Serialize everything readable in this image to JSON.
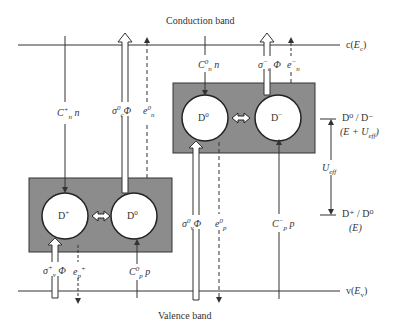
{
  "titles": {
    "conduction_band": "Conduction band",
    "valence_band": "Valence band"
  },
  "band_edges": {
    "conduction": {
      "prefix": "c(",
      "symbol": "E",
      "sub": "c",
      "suffix": ")"
    },
    "valence": {
      "prefix": "v(",
      "symbol": "E",
      "sub": "v",
      "suffix": ")"
    }
  },
  "states": {
    "left_box": {
      "left": "D",
      "left_sup": "+",
      "right": "D",
      "right_sup": "0"
    },
    "right_box": {
      "left": "D",
      "left_sup": "0",
      "right": "D",
      "right_sup": "−"
    }
  },
  "transitions": {
    "cn_plus": {
      "sym": "C",
      "sup": "+",
      "sub": "n",
      "var": "n"
    },
    "sigma_c0": {
      "sym": "σ",
      "sup": "0",
      "sub": "c",
      "var": "Φ"
    },
    "e_n0": {
      "sym": "e",
      "sup": "0",
      "sub": "n"
    },
    "cn0": {
      "sym": "C",
      "sup": "0",
      "sub": "n",
      "var": "n"
    },
    "sigma_c_minus": {
      "sym": "σ",
      "sup": "−",
      "sub": "c",
      "var": "Φ"
    },
    "e_n_minus": {
      "sym": "e",
      "sup": "−",
      "sub": "n"
    },
    "sigma_v_plus": {
      "sym": "σ",
      "sup": "+",
      "sub": "v",
      "var": "Φ"
    },
    "e_p_plus": {
      "sym": "e",
      "sup": "+",
      "sub": "p"
    },
    "cp0": {
      "sym": "C",
      "sup": "0",
      "sub": "p",
      "var": "p"
    },
    "sigma_v0": {
      "sym": "σ",
      "sup": "0",
      "sub": "v",
      "var": "Φ"
    },
    "e_p0": {
      "sym": "e",
      "sup": "0",
      "sub": "p"
    },
    "cp_minus": {
      "sym": "C",
      "sup": "−",
      "sub": "p",
      "var": "p"
    }
  },
  "levels": {
    "upper": {
      "label": "D⁰ / D⁻",
      "energy": "(E + U",
      "energy_sub": "eff",
      "energy_close": ")"
    },
    "lower": {
      "label": "D⁺ / D⁰",
      "energy": "(E)"
    },
    "separation": {
      "sym": "U",
      "sub": "eff"
    }
  },
  "colors": {
    "box_fill": "#8c8c8c",
    "line": "#333333",
    "circle_fill": "#ffffff"
  }
}
